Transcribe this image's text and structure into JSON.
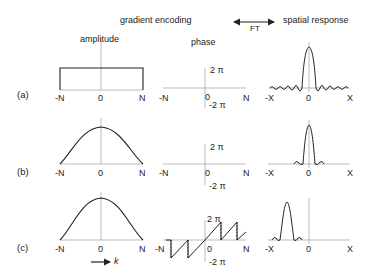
{
  "header": {
    "title": "gradient encoding",
    "ft_label": "FT",
    "right_title": "spatial response"
  },
  "columns": {
    "amplitude": "amplitude",
    "phase": "phase"
  },
  "rows": [
    {
      "label": "(a)",
      "amplitude": {
        "shape": "rect",
        "ticks": [
          "-N",
          "0",
          "N"
        ]
      },
      "phase": {
        "shape": "flat",
        "ticks": [
          "-N",
          "0",
          "N"
        ],
        "top": "2 π",
        "bottom": "-2 π"
      },
      "spatial": {
        "shape": "sinc",
        "ticks": [
          "-X",
          "0",
          "X"
        ]
      }
    },
    {
      "label": "(b)",
      "amplitude": {
        "shape": "gaussian",
        "ticks": [
          "-N",
          "0",
          "N"
        ]
      },
      "phase": {
        "shape": "flat",
        "ticks": [
          "-N",
          "0",
          "N"
        ],
        "top": "2 π",
        "bottom": "-2 π"
      },
      "spatial": {
        "shape": "narrow-peak",
        "ticks": [
          "-X",
          "0",
          "X"
        ]
      }
    },
    {
      "label": "(c)",
      "amplitude": {
        "shape": "gaussian",
        "ticks": [
          "-N",
          "0",
          "N"
        ]
      },
      "phase": {
        "shape": "sawtooth",
        "ticks": [
          "-N",
          "0",
          "N"
        ],
        "top": "2 π",
        "bottom": "-2 π"
      },
      "spatial": {
        "shape": "shifted-peak",
        "ticks": [
          "-X",
          "0",
          "X"
        ]
      }
    }
  ],
  "k_axis_label": "k"
}
